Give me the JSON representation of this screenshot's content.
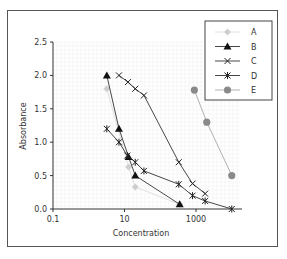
{
  "chart_data": {
    "type": "line",
    "title": "",
    "xlabel": "Concentration",
    "ylabel": "Absorbance",
    "xscale": "log",
    "xlim": [
      0.1,
      10000
    ],
    "ylim": [
      0,
      2.5
    ],
    "xticks": [
      0.1,
      10,
      1000
    ],
    "xtick_labels": [
      "0.1",
      "10",
      "1000"
    ],
    "yticks": [
      0.0,
      0.5,
      1.0,
      1.5,
      2.0,
      2.5
    ],
    "ytick_labels": [
      "0.0",
      "0.5",
      "1.0",
      "1.5",
      "2.0",
      "2.5"
    ],
    "grid": true,
    "legend_position": "upper right",
    "series": [
      {
        "name": "A",
        "marker": "diamond",
        "color": "#cfcfcf",
        "x": [
          3.2,
          13,
          20,
          350
        ],
        "y": [
          1.8,
          0.63,
          0.33,
          0.07
        ]
      },
      {
        "name": "B",
        "marker": "triangle",
        "color": "#111111",
        "x": [
          3.2,
          7,
          13,
          20,
          350
        ],
        "y": [
          2.0,
          1.2,
          0.78,
          0.5,
          0.07
        ]
      },
      {
        "name": "C",
        "marker": "x",
        "color": "#222222",
        "x": [
          7,
          12.5,
          20,
          35,
          330,
          800,
          1800
        ],
        "y": [
          2.0,
          1.9,
          1.8,
          1.7,
          0.7,
          0.38,
          0.23
        ]
      },
      {
        "name": "D",
        "marker": "asterisk",
        "color": "#222222",
        "x": [
          3.2,
          7,
          12,
          20,
          35,
          330,
          800,
          1800,
          10000
        ],
        "y": [
          1.2,
          1.0,
          0.8,
          0.7,
          0.57,
          0.37,
          0.2,
          0.12,
          0.0
        ]
      },
      {
        "name": "E",
        "marker": "circle",
        "color": "#8a8a8a",
        "x": [
          900,
          2000,
          10000
        ],
        "y": [
          1.78,
          1.3,
          0.5
        ]
      }
    ]
  }
}
